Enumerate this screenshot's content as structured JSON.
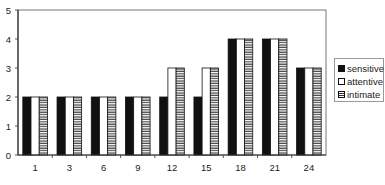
{
  "chart_data": {
    "type": "bar",
    "title": "",
    "xlabel": "",
    "ylabel": "",
    "categories": [
      "1",
      "3",
      "6",
      "9",
      "12",
      "15",
      "18",
      "21",
      "24"
    ],
    "series": [
      {
        "name": "sensitive",
        "values": [
          2,
          2,
          2,
          2,
          2,
          2,
          4,
          4,
          3
        ],
        "fill": "#111111"
      },
      {
        "name": "attentive",
        "values": [
          2,
          2,
          2,
          2,
          3,
          3,
          4,
          4,
          3
        ],
        "fill": "#ffffff"
      },
      {
        "name": "intimate",
        "values": [
          2,
          2,
          2,
          2,
          3,
          3,
          4,
          4,
          3
        ],
        "fill": "horizontal-stripes"
      }
    ],
    "ylim": [
      0,
      5
    ],
    "yticks": [
      0,
      1,
      2,
      3,
      4,
      5
    ],
    "grid": false,
    "legend_position": "right"
  },
  "legend": {
    "items": [
      {
        "label": "sensitive"
      },
      {
        "label": "attentive"
      },
      {
        "label": "intimate"
      }
    ]
  }
}
